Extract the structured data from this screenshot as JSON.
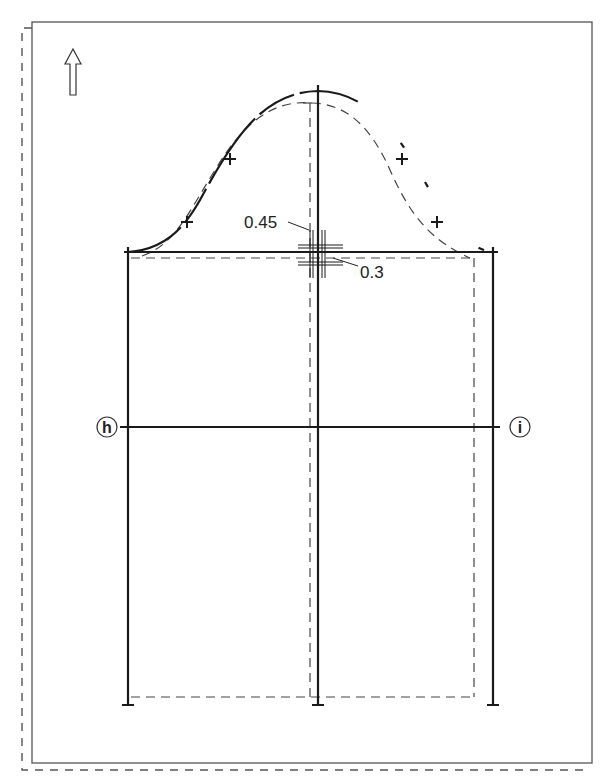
{
  "diagram": {
    "grain_arrow": "grain-line-arrow",
    "measurements": [
      {
        "label": "0.45",
        "target": "dashed-center-offset"
      },
      {
        "label": "0.3",
        "target": "dashed-capline-offset"
      }
    ],
    "markers": [
      {
        "label": "h",
        "side": "left"
      },
      {
        "label": "i",
        "side": "right"
      }
    ],
    "colors": {
      "line": "#1a1a1a",
      "dash": "#444444",
      "frame": "#555555",
      "background": "#ffffff"
    }
  }
}
